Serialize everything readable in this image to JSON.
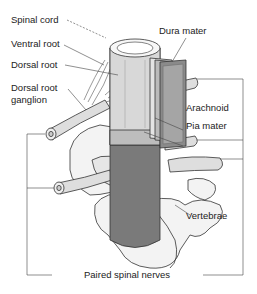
{
  "diagram": {
    "labels": {
      "spinal_cord": "Spinal cord",
      "ventral_root": "Ventral root",
      "dorsal_root": "Dorsal root",
      "dorsal_root_ganglion_line1": "Dorsal root",
      "dorsal_root_ganglion_line2": "ganglion",
      "dura_mater": "Dura mater",
      "arachnoid": "Arachnoid",
      "pia_mater": "Pia mater",
      "vertebrae": "Vertebrae",
      "paired_spinal_nerves": "Paired spinal nerves"
    },
    "colors": {
      "dark_gray": "#6e6e6e",
      "mid_gray": "#9a9a9a",
      "light_gray": "#d4d4d4",
      "bone": "#f2f2f2",
      "line": "#444444"
    }
  }
}
